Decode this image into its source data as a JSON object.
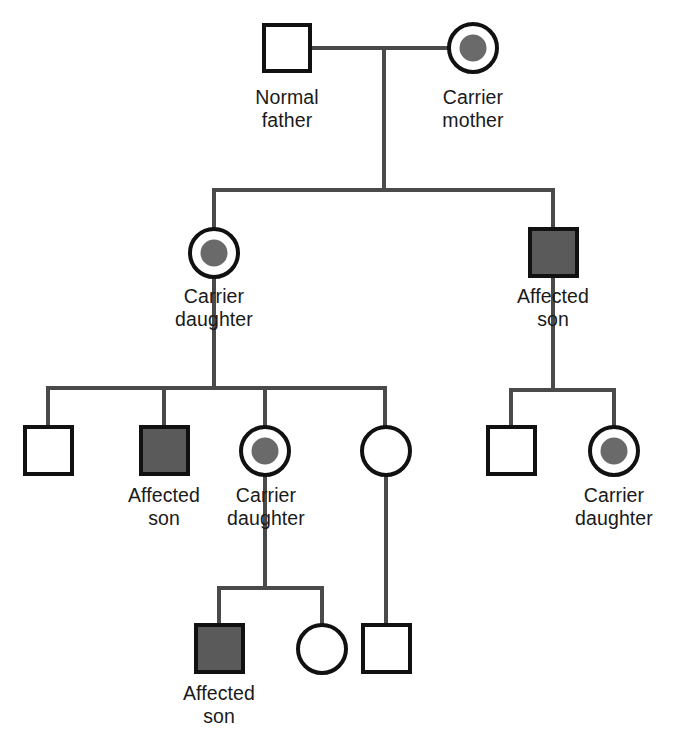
{
  "diagram": {
    "symbol_legend": {
      "square": "male",
      "circle": "female",
      "filled_gray": "affected",
      "dot_center": "carrier"
    },
    "colors": {
      "affected_fill": "#5a5a5a",
      "carrier_dot": "#6a6a6a",
      "symbol_stroke": "#111111",
      "line_stroke": "#4a4a4a",
      "background": "#ffffff",
      "label_text": "#1a1a1a"
    },
    "labels": {
      "normal_father": {
        "line1": "Normal",
        "line2": "father"
      },
      "carrier_mother": {
        "line1": "Carrier",
        "line2": "mother"
      },
      "carrier_daughter_g2": {
        "line1": "Carrier",
        "line2": "daughter"
      },
      "affected_son_g2": {
        "line1": "Affected",
        "line2": "son"
      },
      "affected_son_g3": {
        "line1": "Affected",
        "line2": "son"
      },
      "carrier_daughter_g3": {
        "line1": "Carrier",
        "line2": "daughter"
      },
      "carrier_daughter_g3_right": {
        "line1": "Carrier",
        "line2": "daughter"
      },
      "affected_son_g4": {
        "line1": "Affected",
        "line2": "son"
      }
    },
    "generations": [
      {
        "id": "generation-1",
        "members": [
          {
            "id": "normal-father",
            "sex": "male",
            "status": "unaffected",
            "label": "Normal father"
          },
          {
            "id": "carrier-mother",
            "sex": "female",
            "status": "carrier",
            "label": "Carrier mother"
          }
        ]
      },
      {
        "id": "generation-2",
        "members": [
          {
            "id": "carrier-daughter-g2",
            "sex": "female",
            "status": "carrier",
            "label": "Carrier daughter"
          },
          {
            "id": "affected-son-g2",
            "sex": "male",
            "status": "affected",
            "label": "Affected son"
          }
        ]
      },
      {
        "id": "generation-3",
        "members": [
          {
            "id": "unaffected-son-g3-a",
            "sex": "male",
            "status": "unaffected",
            "label": ""
          },
          {
            "id": "affected-son-g3",
            "sex": "male",
            "status": "affected",
            "label": "Affected son"
          },
          {
            "id": "carrier-daughter-g3",
            "sex": "female",
            "status": "carrier",
            "label": "Carrier daughter"
          },
          {
            "id": "unaffected-daughter-g3",
            "sex": "female",
            "status": "unaffected",
            "label": ""
          },
          {
            "id": "unaffected-son-g3-b",
            "sex": "male",
            "status": "unaffected",
            "label": ""
          },
          {
            "id": "carrier-daughter-g3-right",
            "sex": "female",
            "status": "carrier",
            "label": "Carrier daughter"
          }
        ]
      },
      {
        "id": "generation-4",
        "members": [
          {
            "id": "affected-son-g4",
            "sex": "male",
            "status": "affected",
            "label": "Affected son"
          },
          {
            "id": "unaffected-daughter-g4",
            "sex": "female",
            "status": "unaffected",
            "label": ""
          },
          {
            "id": "unaffected-son-g4",
            "sex": "male",
            "status": "unaffected",
            "label": ""
          }
        ]
      }
    ]
  }
}
